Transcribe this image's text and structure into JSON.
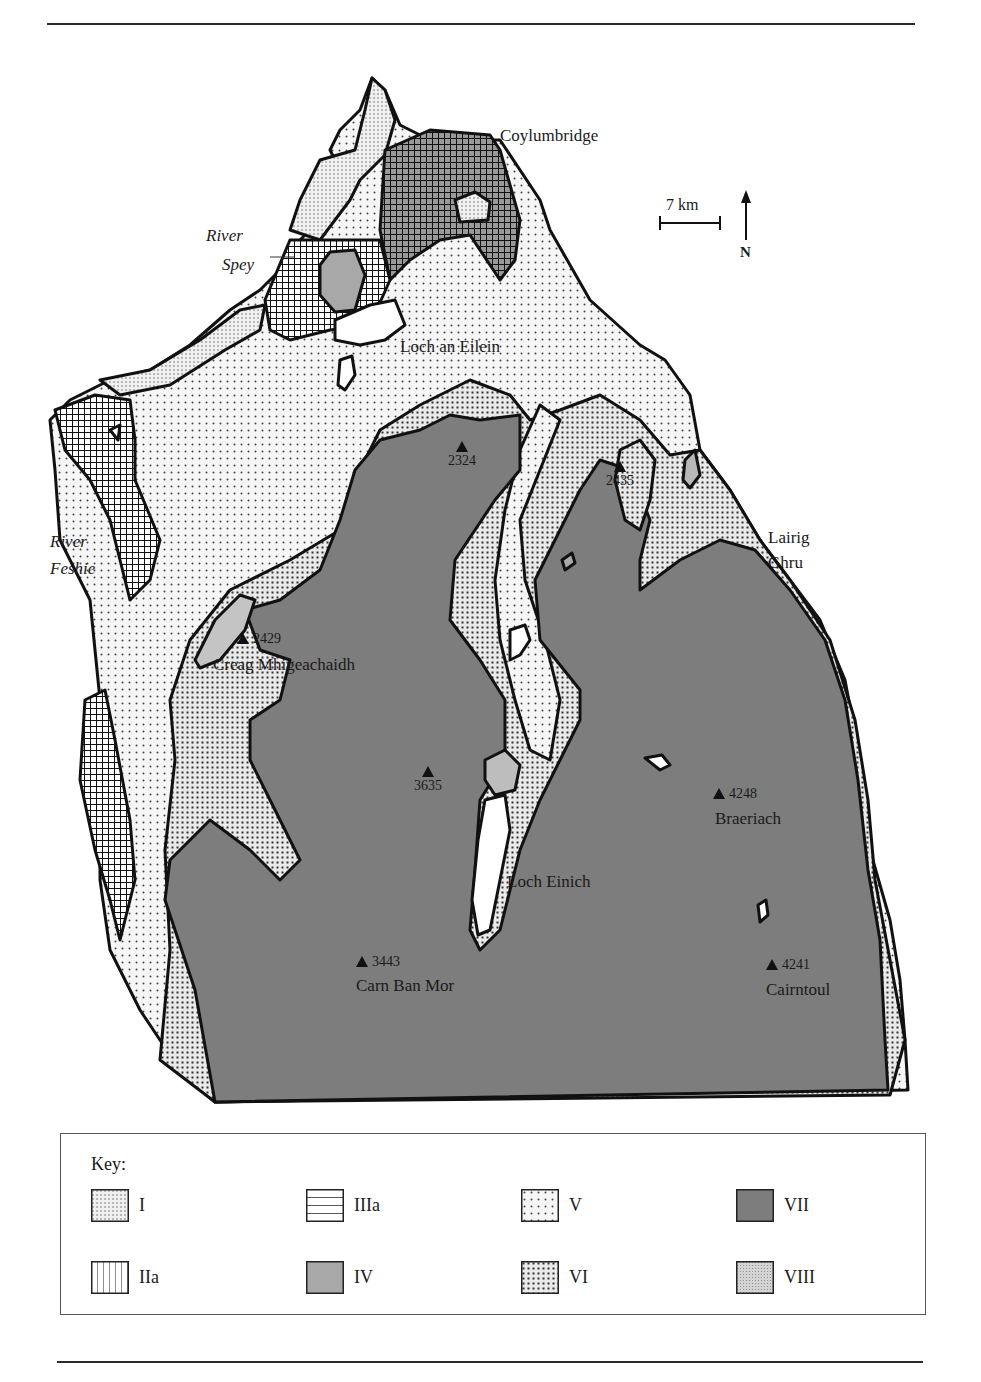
{
  "map": {
    "place_labels": [
      {
        "id": "coylumbridge",
        "text": "Coylumbridge",
        "italic": false,
        "x": 500,
        "y": 127
      },
      {
        "id": "river-spey-1",
        "text": "River",
        "italic": true,
        "x": 206,
        "y": 227
      },
      {
        "id": "river-spey-2",
        "text": "Spey",
        "italic": true,
        "x": 222,
        "y": 256
      },
      {
        "id": "loch-an-eilein",
        "text": "Loch an Eilein",
        "italic": false,
        "x": 400,
        "y": 338
      },
      {
        "id": "river-feshie-1",
        "text": "River",
        "italic": true,
        "x": 50,
        "y": 533
      },
      {
        "id": "river-feshie-2",
        "text": "Feshie",
        "italic": true,
        "x": 50,
        "y": 560
      },
      {
        "id": "lairig-ghru-1",
        "text": "Lairig",
        "italic": false,
        "x": 768,
        "y": 529
      },
      {
        "id": "lairig-ghru-2",
        "text": "Ghru",
        "italic": false,
        "x": 768,
        "y": 554
      },
      {
        "id": "creag-mhigeachaidh",
        "text": "Creag Mhigeachaidh",
        "italic": false,
        "x": 213,
        "y": 656
      },
      {
        "id": "loch-einich",
        "text": "Loch Einich",
        "italic": false,
        "x": 507,
        "y": 873
      },
      {
        "id": "braeriach",
        "text": "Braeriach",
        "italic": false,
        "x": 715,
        "y": 810
      },
      {
        "id": "carn-ban-mor",
        "text": "Carn Ban Mor",
        "italic": false,
        "x": 356,
        "y": 977
      },
      {
        "id": "cairntoul",
        "text": "Cairntoul",
        "italic": false,
        "x": 766,
        "y": 981
      }
    ],
    "peaks": [
      {
        "id": "2324",
        "height": "2324",
        "x": 448,
        "y": 441,
        "stacked": true
      },
      {
        "id": "2435",
        "height": "2435",
        "x": 606,
        "y": 461,
        "stacked": true
      },
      {
        "id": "2429",
        "height": "2429",
        "x": 237,
        "y": 632,
        "stacked": false
      },
      {
        "id": "3635",
        "height": "3635",
        "x": 414,
        "y": 766,
        "stacked": true
      },
      {
        "id": "4248",
        "height": "4248",
        "x": 713,
        "y": 787,
        "stacked": false
      },
      {
        "id": "3443",
        "height": "3443",
        "x": 356,
        "y": 955,
        "stacked": false
      },
      {
        "id": "4241",
        "height": "4241",
        "x": 766,
        "y": 958,
        "stacked": false
      }
    ],
    "scale_bar": {
      "label": "7 km"
    },
    "north_arrow": {
      "label": "N"
    }
  },
  "key": {
    "title": "Key:",
    "items": [
      {
        "code": "I",
        "pattern": "I"
      },
      {
        "code": "IIIa",
        "pattern": "IIIa"
      },
      {
        "code": "V",
        "pattern": "V"
      },
      {
        "code": "VII",
        "pattern": "VII"
      },
      {
        "code": "IIa",
        "pattern": "IIa"
      },
      {
        "code": "IV",
        "pattern": "IV"
      },
      {
        "code": "VI",
        "pattern": "VI"
      },
      {
        "code": "VIII",
        "pattern": "VIII"
      }
    ]
  },
  "colors": {
    "zone_VII": "#7d7d7d",
    "zone_IV": "#a8a8a8",
    "zone_VIII": "#c8c8c8",
    "outline": "#111111"
  }
}
